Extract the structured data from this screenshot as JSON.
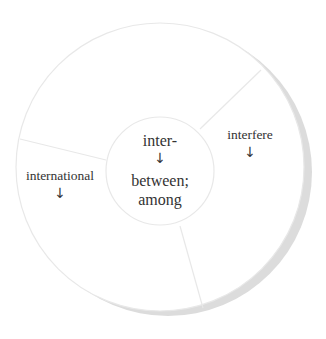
{
  "diagram": {
    "type": "word-root wheel",
    "center": {
      "root": "inter-",
      "arrow": "↓",
      "meaning_line1": "between;",
      "meaning_line2": "among"
    },
    "segments": [
      {
        "word": "interfere",
        "arrow": "↓"
      },
      {
        "word": "international",
        "arrow": "↓"
      },
      {
        "word": "",
        "arrow": ""
      }
    ],
    "colors": {
      "background": "#ffffff",
      "circle_fill": "#ffffff",
      "circle_stroke": "#e8e8e8",
      "shadow": "#dcdcdc",
      "text": "#333333"
    }
  }
}
